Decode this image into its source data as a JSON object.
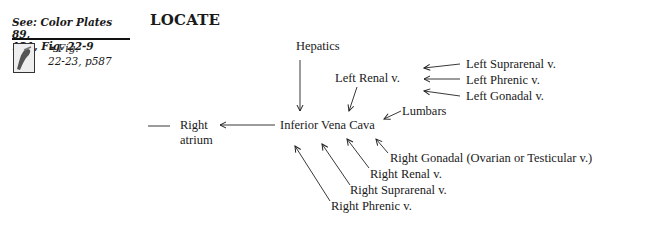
{
  "sidebar": {
    "see_line1": "See: Color Plates 89,",
    "see_line2": "121, Fig. 22-9",
    "link_icon": "chain-link-icon",
    "link_line1": "Fig.",
    "link_line2": "22-23, p587"
  },
  "heading": "LOCATE",
  "diagram": {
    "center": "Inferior Vena Cava",
    "right_atrium_line1": "Right",
    "right_atrium_line2": "atrium",
    "hepatics": "Hepatics",
    "left_renal": "Left Renal v.",
    "left_suprarenal": "Left Suprarenal v.",
    "left_phrenic": "Left Phrenic v.",
    "left_gonadal": "Left Gonadal v.",
    "lumbars": "Lumbars",
    "right_gonadal": "Right Gonadal (Ovarian or Testicular v.)",
    "right_renal": "Right Renal v.",
    "right_suprarenal": "Right Suprarenal v.",
    "right_phrenic": "Right Phrenic v."
  }
}
